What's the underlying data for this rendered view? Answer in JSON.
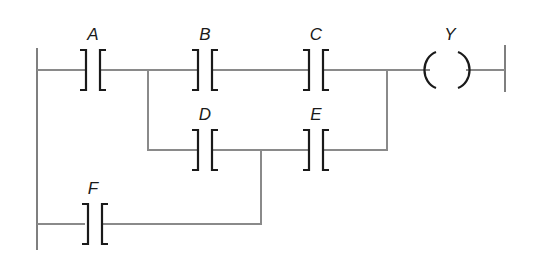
{
  "diagram": {
    "type": "ladder-logic",
    "colors": {
      "rail": "#555555",
      "wire": "#8a8a8a",
      "contact": "#1a1a1a"
    },
    "contacts": [
      {
        "id": "A",
        "label": "A",
        "x": 93,
        "y": 70,
        "label_y": 23
      },
      {
        "id": "B",
        "label": "B",
        "x": 205,
        "y": 70,
        "label_y": 23
      },
      {
        "id": "C",
        "label": "C",
        "x": 316,
        "y": 70,
        "label_y": 23
      },
      {
        "id": "D",
        "label": "D",
        "x": 205,
        "y": 150,
        "label_y": 104
      },
      {
        "id": "E",
        "label": "E",
        "x": 316,
        "y": 150,
        "label_y": 104
      },
      {
        "id": "F",
        "label": "F",
        "x": 93,
        "y": 224,
        "label_y": 177
      }
    ],
    "coil": {
      "id": "Y",
      "label": "Y",
      "x": 448,
      "y": 70,
      "label_y": 23
    }
  }
}
